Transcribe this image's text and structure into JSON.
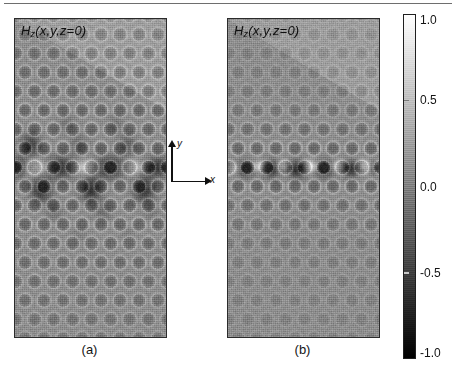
{
  "figure": {
    "title_rule": "horizontal-rule",
    "background": "#ffffff"
  },
  "panels": [
    {
      "id": "a",
      "caption": "(a)",
      "label_html_parts": {
        "H": "H",
        "sub": "z",
        "args": "(x,y,z=0)"
      },
      "label_text": "Hz(x,y,z=0)",
      "description": "delocalized photonic crystal defect mode"
    },
    {
      "id": "b",
      "caption": "(b)",
      "label_html_parts": {
        "H": "H",
        "sub": "z",
        "args": "(x,y,z=0)"
      },
      "label_text": "Hz(x,y,z=0)",
      "description": "tightly confined photonic crystal waveguide mode"
    }
  ],
  "axes_indicator": {
    "x_label": "x",
    "y_label": "y"
  },
  "colorbar": {
    "min": -1.0,
    "max": 1.0,
    "ticks": [
      1.0,
      0.5,
      0.0,
      -0.5,
      -1.0
    ],
    "tick_labels": [
      "1.0",
      "0.5",
      "0.0",
      "-0.5",
      "-1.0"
    ],
    "colormap": "grayscale",
    "top_color": "#ffffff",
    "bottom_color": "#000000"
  },
  "chart_data": {
    "type": "heatmap",
    "xlabel": "x",
    "ylabel": "y",
    "legend_position": "right",
    "grid": false,
    "colorbar_label": "",
    "zlim": [
      -1.0,
      1.0
    ],
    "colormap": "gray",
    "background_value": 0.0,
    "background_color": "#9a9a9a",
    "panels": [
      {
        "id": "a",
        "caption": "(a)",
        "field_label": "Hz(x,y,z=0)",
        "lattice": {
          "type": "triangular",
          "rod_columns": 8,
          "rod_rows": 13,
          "column_spacing_px": 19,
          "row_spacing_px": 19,
          "rod_radius_px": 6.5,
          "defect_row_index": 6
        },
        "mode": "delocalized-defect-mode",
        "defect_line_y_frac": 0.465,
        "peak_positive": 1.0,
        "peak_negative": -1.0,
        "decay_rows": 5,
        "lobes": [
          {
            "x_frac": 0.02,
            "y_frac": 0.465,
            "amp": -0.95,
            "rx": 0.055,
            "ry": 0.022
          },
          {
            "x_frac": 0.14,
            "y_frac": 0.465,
            "amp": 0.85,
            "rx": 0.075,
            "ry": 0.02
          },
          {
            "x_frac": 0.3,
            "y_frac": 0.465,
            "amp": -1.0,
            "rx": 0.095,
            "ry": 0.024
          },
          {
            "x_frac": 0.46,
            "y_frac": 0.465,
            "amp": 0.9,
            "rx": 0.08,
            "ry": 0.02
          },
          {
            "x_frac": 0.62,
            "y_frac": 0.465,
            "amp": -1.0,
            "rx": 0.095,
            "ry": 0.024
          },
          {
            "x_frac": 0.78,
            "y_frac": 0.465,
            "amp": 0.8,
            "rx": 0.07,
            "ry": 0.019
          },
          {
            "x_frac": 0.93,
            "y_frac": 0.465,
            "amp": -0.9,
            "rx": 0.08,
            "ry": 0.022
          },
          {
            "x_frac": 0.1,
            "y_frac": 0.395,
            "amp": -0.8,
            "rx": 0.048,
            "ry": 0.026
          },
          {
            "x_frac": 0.42,
            "y_frac": 0.395,
            "amp": -0.35,
            "rx": 0.042,
            "ry": 0.024
          },
          {
            "x_frac": 0.74,
            "y_frac": 0.395,
            "amp": -0.45,
            "rx": 0.042,
            "ry": 0.024
          },
          {
            "x_frac": 0.17,
            "y_frac": 0.535,
            "amp": -0.95,
            "rx": 0.05,
            "ry": 0.028
          },
          {
            "x_frac": 0.5,
            "y_frac": 0.535,
            "amp": -0.95,
            "rx": 0.05,
            "ry": 0.028
          },
          {
            "x_frac": 0.85,
            "y_frac": 0.535,
            "amp": -0.95,
            "rx": 0.05,
            "ry": 0.028
          },
          {
            "x_frac": 0.34,
            "y_frac": 0.33,
            "amp": -0.3,
            "rx": 0.04,
            "ry": 0.022
          },
          {
            "x_frac": 0.66,
            "y_frac": 0.33,
            "amp": -0.3,
            "rx": 0.04,
            "ry": 0.022
          },
          {
            "x_frac": 0.26,
            "y_frac": 0.605,
            "amp": -0.35,
            "rx": 0.04,
            "ry": 0.022
          },
          {
            "x_frac": 0.58,
            "y_frac": 0.605,
            "amp": -0.38,
            "rx": 0.04,
            "ry": 0.022
          },
          {
            "x_frac": 0.9,
            "y_frac": 0.605,
            "amp": -0.25,
            "rx": 0.038,
            "ry": 0.02
          },
          {
            "x_frac": 0.42,
            "y_frac": 0.675,
            "amp": -0.22,
            "rx": 0.036,
            "ry": 0.02
          },
          {
            "x_frac": 0.74,
            "y_frac": 0.675,
            "amp": -0.18,
            "rx": 0.034,
            "ry": 0.018
          }
        ]
      },
      {
        "id": "b",
        "caption": "(b)",
        "field_label": "Hz(x,y,z=0)",
        "lattice": {
          "type": "triangular",
          "rod_columns": 8,
          "rod_rows": 13,
          "column_spacing_px": 19,
          "row_spacing_px": 19,
          "rod_radius_px": 6.5,
          "defect_row_index": 6
        },
        "mode": "confined-waveguide-mode",
        "defect_line_y_frac": 0.465,
        "peak_positive": 1.0,
        "peak_negative": -1.0,
        "decay_rows": 1,
        "lobes": [
          {
            "x_frac": 0.035,
            "y_frac": 0.468,
            "amp": 0.55,
            "rx": 0.03,
            "ry": 0.013
          },
          {
            "x_frac": 0.115,
            "y_frac": 0.47,
            "amp": -1.0,
            "rx": 0.042,
            "ry": 0.02
          },
          {
            "x_frac": 0.2,
            "y_frac": 0.462,
            "amp": 0.75,
            "rx": 0.032,
            "ry": 0.014
          },
          {
            "x_frac": 0.28,
            "y_frac": 0.47,
            "amp": -1.0,
            "rx": 0.044,
            "ry": 0.021
          },
          {
            "x_frac": 0.36,
            "y_frac": 0.462,
            "amp": 0.7,
            "rx": 0.03,
            "ry": 0.014
          },
          {
            "x_frac": 0.455,
            "y_frac": 0.472,
            "amp": -1.0,
            "rx": 0.044,
            "ry": 0.022
          },
          {
            "x_frac": 0.545,
            "y_frac": 0.462,
            "amp": 0.85,
            "rx": 0.032,
            "ry": 0.015
          },
          {
            "x_frac": 0.635,
            "y_frac": 0.47,
            "amp": -1.0,
            "rx": 0.044,
            "ry": 0.021
          },
          {
            "x_frac": 0.72,
            "y_frac": 0.462,
            "amp": 0.65,
            "rx": 0.03,
            "ry": 0.014
          },
          {
            "x_frac": 0.81,
            "y_frac": 0.47,
            "amp": -0.95,
            "rx": 0.04,
            "ry": 0.02
          },
          {
            "x_frac": 0.9,
            "y_frac": 0.462,
            "amp": 0.8,
            "rx": 0.03,
            "ry": 0.014
          },
          {
            "x_frac": 0.965,
            "y_frac": 0.468,
            "amp": -0.5,
            "rx": 0.03,
            "ry": 0.016
          }
        ]
      }
    ]
  }
}
